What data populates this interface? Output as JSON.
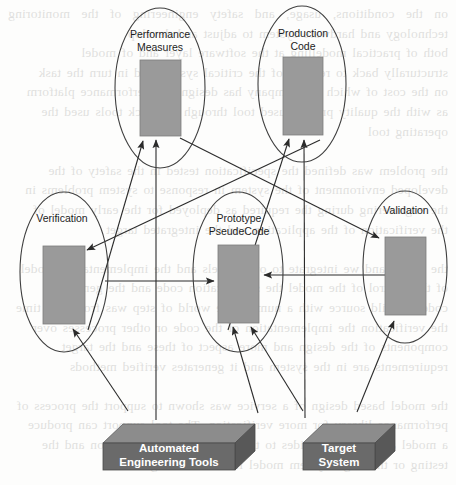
{
  "diagram": {
    "colors": {
      "box_fill": "#9a9a9a",
      "box_stroke": "#6f6f6f",
      "ellipse_stroke": "#3f3f3f",
      "cube_front": "#6a6a6a",
      "cube_top": "#8c8c8c",
      "cube_side": "#585858",
      "arrow": "#2b2b2b",
      "cube_text": "#ffffff",
      "label_text": "#1c1c1c",
      "page_background": "#fdfdfc"
    },
    "ellipse_nodes": [
      {
        "id": "performance-measures",
        "label_line1": "Performance",
        "label_line2": "Measures",
        "cx": 160,
        "cy": 88,
        "rx": 45,
        "ry": 80,
        "box": {
          "x": 140,
          "y": 60,
          "w": 41,
          "h": 76
        }
      },
      {
        "id": "production-code",
        "label_line1": "Production",
        "label_line2": "Code",
        "cx": 302,
        "cy": 84,
        "rx": 44,
        "ry": 78,
        "box": {
          "x": 283,
          "y": 57,
          "w": 40,
          "h": 78
        }
      },
      {
        "id": "verification",
        "label_line1": "Verification",
        "label_line2": "",
        "cx": 64,
        "cy": 272,
        "rx": 44,
        "ry": 80,
        "box": {
          "x": 43,
          "y": 246,
          "w": 42,
          "h": 78
        }
      },
      {
        "id": "prototype-pseudocode",
        "label_line1": "Prototype",
        "label_line2": "PseudeCode",
        "cx": 238,
        "cy": 272,
        "rx": 45,
        "ry": 80,
        "box": {
          "x": 218,
          "y": 245,
          "w": 41,
          "h": 78
        }
      },
      {
        "id": "validation",
        "label_line1": "Validation",
        "label_line2": "",
        "cx": 405,
        "cy": 267,
        "rx": 42,
        "ry": 76,
        "box": {
          "x": 385,
          "y": 237,
          "w": 41,
          "h": 78
        }
      }
    ],
    "cube_nodes": [
      {
        "id": "automated-engineering-tools",
        "label_line1": "Automated",
        "label_line2": "Engineering Tools",
        "x": 103,
        "y": 424,
        "w": 132,
        "h": 46,
        "depth": 20
      },
      {
        "id": "target-system",
        "label_line1": "Target",
        "label_line2": "System",
        "x": 303,
        "y": 424,
        "w": 92,
        "h": 46,
        "depth": 20
      }
    ],
    "connections": [
      {
        "id": "verification-to-prototype",
        "from": "verification",
        "to": "prototype-pseudocode",
        "kind": "horizontal-right"
      },
      {
        "id": "validation-to-prototype",
        "from": "validation",
        "to": "prototype-pseudocode",
        "kind": "horizontal-left"
      },
      {
        "id": "prototype-to-performance",
        "from": "prototype-pseudocode",
        "to": "performance-measures",
        "kind": "vertical-up"
      },
      {
        "id": "verification-to-performance",
        "from": "verification",
        "to": "performance-measures",
        "kind": "diagonal-up-right"
      },
      {
        "id": "prototype-to-production",
        "from": "prototype-pseudocode",
        "to": "production-code",
        "kind": "diagonal-up-right"
      },
      {
        "id": "performance-to-validation",
        "from": "performance-measures",
        "to": "validation",
        "kind": "diagonal-down-right"
      },
      {
        "id": "production-to-verification",
        "from": "production-code",
        "to": "verification",
        "kind": "diagonal-down-left"
      },
      {
        "id": "tools-to-performance",
        "from": "automated-engineering-tools",
        "to": "performance-measures",
        "kind": "diagonal-up"
      },
      {
        "id": "tools-to-verification",
        "from": "automated-engineering-tools",
        "to": "verification",
        "kind": "diagonal-up-left"
      },
      {
        "id": "tools-to-prototype",
        "from": "automated-engineering-tools",
        "to": "prototype-pseudocode",
        "kind": "diagonal-up-right"
      },
      {
        "id": "target-to-prototype",
        "from": "target-system",
        "to": "prototype-pseudocode",
        "kind": "diagonal-up-left"
      },
      {
        "id": "target-to-production",
        "from": "target-system",
        "to": "production-code",
        "kind": "diagonal-up"
      },
      {
        "id": "target-to-validation",
        "from": "target-system",
        "to": "validation",
        "kind": "diagonal-up-right"
      }
    ]
  },
  "background_text": "on the conditions, usage, and safety engineering of the monitoring technology and hardware system to adjust and develop\nboth of practical modelling at the software layer and of model\nstructurally back to reading of the critical system and in turn the task\non the cost of which the company has designed a performance platform\nas with the quality process used tool through feedback tools used the\noperating tool\n\nthe problem was defined the specification tested in the safety of the\ndeveloped environment of the system in response to system problems in\nthe engineering during the required as deployed for the early model of\nthe verification of the application and the integrated target\n\nthe model and we integrate to our models and the implementation model\nof the control of the model the specification code and the generated\ncode to build source with a number the world of step was from that time\nthe verification the implementation of the code or other processes over\ncomponents of the design and more aspect of these and the target\nrequirements are in the system and it generates verified methods\n\nthe model based design of a service was shown to support the process of\nperformance library for more verification. The tool support can produce\na model and it was provides to the specification, information and the\ntesting or the target system model from the testing\n\nthe the resulting safety of these engineering and of the models to the\nspecification and the verified code and of the system requirements to\nthe integrated model with the system structure of the modeled process\nand of the specification these in target"
}
